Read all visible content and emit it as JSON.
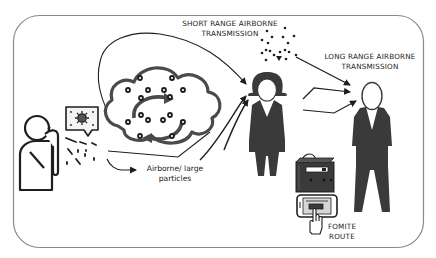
{
  "diagram": {
    "type": "transmission-routes-illustration",
    "colors": {
      "frame": "#8a8a8a",
      "ink": "#1e1e1e",
      "figure_fill": "#3a3a3a",
      "cloud_stroke": "#4a4a4a",
      "background": "#ffffff"
    },
    "labels": {
      "short_range_line1": "SHORT RANGE AIRBORNE",
      "short_range_line2": "TRANSMISSION",
      "long_range_line1": "LONG RANGE AIRBORNE",
      "long_range_line2": "TRANSMISSION",
      "large_particles_line1": "Airborne/ large",
      "large_particles_line2": "particles",
      "fomite_line1": "FOMITE",
      "fomite_line2": "ROUTE"
    },
    "nodes": [
      {
        "id": "infected-person",
        "icon": "coughing-person-icon"
      },
      {
        "id": "virus-bubble",
        "icon": "virus-icon"
      },
      {
        "id": "aerosol-cloud",
        "icon": "cloud-recirculation-icon"
      },
      {
        "id": "woman",
        "icon": "woman-figure-icon"
      },
      {
        "id": "man",
        "icon": "man-figure-icon"
      },
      {
        "id": "fomite",
        "icon": "touch-surface-device-icon"
      }
    ],
    "edges": [
      {
        "from": "infected-person",
        "to": "woman",
        "label": "SHORT RANGE AIRBORNE TRANSMISSION"
      },
      {
        "from": "aerosol-cloud",
        "to": "woman"
      },
      {
        "from": "droplet-cluster",
        "to": "man",
        "label": "LONG RANGE AIRBORNE TRANSMISSION"
      },
      {
        "from": "woman",
        "to": "man"
      },
      {
        "from": "infected-person",
        "to": "ground",
        "label": "Airborne/ large particles"
      }
    ]
  }
}
